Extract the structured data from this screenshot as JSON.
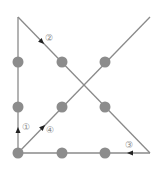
{
  "diagram": {
    "colors": {
      "background": "#ffffff",
      "line": "#8a8a8a",
      "dot": "#8c8c8c",
      "arrow": "#222222",
      "label": "#8a8a8a"
    },
    "dots": [
      {
        "x": 18,
        "y": 62
      },
      {
        "x": 62,
        "y": 62
      },
      {
        "x": 105,
        "y": 62
      },
      {
        "x": 18,
        "y": 107
      },
      {
        "x": 62,
        "y": 107
      },
      {
        "x": 105,
        "y": 107
      },
      {
        "x": 18,
        "y": 153
      },
      {
        "x": 62,
        "y": 153
      },
      {
        "x": 105,
        "y": 153
      }
    ],
    "lines": [
      {
        "id": 1,
        "x1": 18,
        "y1": 153,
        "x2": 18,
        "y2": 17
      },
      {
        "id": 2,
        "x1": 18,
        "y1": 17,
        "x2": 150,
        "y2": 153
      },
      {
        "id": 3,
        "x1": 150,
        "y1": 153,
        "x2": 18,
        "y2": 153
      },
      {
        "id": 4,
        "x1": 18,
        "y1": 153,
        "x2": 150,
        "y2": 17
      }
    ],
    "steps": [
      {
        "label": "①",
        "arrow_x": 18,
        "arrow_y": 130,
        "arrow_dir": "up",
        "label_x": 22,
        "label_y": 127
      },
      {
        "label": "②",
        "arrow_x": 42,
        "arrow_y": 42,
        "arrow_dir": "down-right",
        "label_x": 45,
        "label_y": 38
      },
      {
        "label": "③",
        "arrow_x": 130,
        "arrow_y": 153,
        "arrow_dir": "left",
        "label_x": 125,
        "label_y": 145
      },
      {
        "label": "④",
        "arrow_x": 43,
        "arrow_y": 127,
        "arrow_dir": "up-right",
        "label_x": 46,
        "label_y": 130
      }
    ]
  }
}
